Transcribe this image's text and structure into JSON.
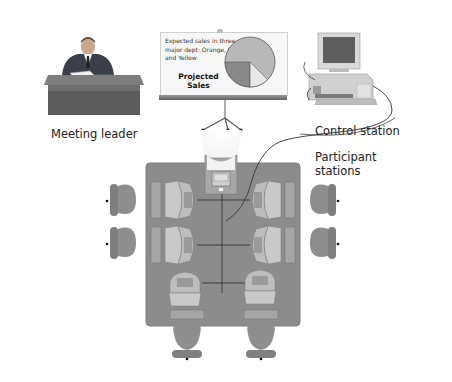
{
  "diagram": {
    "type": "conference-room-layout",
    "labels": {
      "meeting_leader": "Meeting leader",
      "control_station": "Control station",
      "participant_stations_line1": "Participant",
      "participant_stations_line2": "stations"
    },
    "easel": {
      "chart_caption_line1": "Expected sales in three",
      "chart_caption_line2": "major dept: Orange, Red",
      "chart_caption_line3": "and Yellow",
      "chart_title_line1": "Projected",
      "chart_title_line2": "Sales"
    },
    "participant_station_count": 6,
    "chair_count": 6,
    "colors": {
      "table": "#8c8c8c",
      "table_border": "#7a7a7a",
      "chair": "#8e8e8e",
      "pie_main": "#b3b3b3",
      "pie_dark": "#8a8a8a",
      "pie_light": "#e6e6e6",
      "desk": "#6b6b6b",
      "wire": "#333333"
    }
  }
}
